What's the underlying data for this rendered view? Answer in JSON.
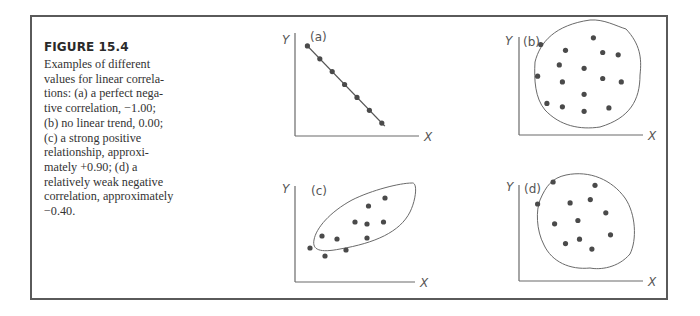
{
  "figure": {
    "title": "FIGURE 15.4",
    "caption_lines": [
      "Examples of different",
      "values for linear correla-",
      "tions: (a) a perfect nega-",
      "tive correlation, −1.00;",
      "(b) no linear trend, 0.00;",
      "(c) a strong positive",
      "relationship, approxi-",
      "mately +0.90; (d) a",
      "relatively weak negative",
      "correlation, approximately",
      "−0.40."
    ]
  },
  "chart_data": [
    {
      "type": "scatter",
      "panel": "(a)",
      "xlabel": "X",
      "ylabel": "Y",
      "correlation": -1.0,
      "description": "perfect negative correlation",
      "fit_line": true,
      "envelope": "none",
      "points": [
        [
          1,
          7
        ],
        [
          2,
          6
        ],
        [
          3,
          5
        ],
        [
          4,
          4
        ],
        [
          5,
          3
        ],
        [
          6,
          2
        ],
        [
          7,
          1
        ]
      ],
      "xlim": [
        0,
        10
      ],
      "ylim": [
        0,
        8
      ]
    },
    {
      "type": "scatter",
      "panel": "(b)",
      "xlabel": "X",
      "ylabel": "Y",
      "correlation": 0.0,
      "description": "no linear trend",
      "envelope": "circle",
      "points": [
        [
          1.4,
          8.0
        ],
        [
          3.0,
          7.5
        ],
        [
          4.8,
          8.6
        ],
        [
          5.4,
          7.3
        ],
        [
          6.4,
          7.1
        ],
        [
          2.6,
          6.2
        ],
        [
          4.2,
          5.9
        ],
        [
          1.2,
          5.2
        ],
        [
          2.8,
          4.7
        ],
        [
          5.4,
          5.0
        ],
        [
          6.6,
          4.7
        ],
        [
          4.2,
          3.6
        ],
        [
          1.8,
          2.8
        ],
        [
          2.8,
          2.5
        ],
        [
          4.2,
          2.1
        ],
        [
          5.8,
          2.4
        ]
      ],
      "xlim": [
        0,
        8
      ],
      "ylim": [
        0,
        10
      ]
    },
    {
      "type": "scatter",
      "panel": "(c)",
      "xlabel": "X",
      "ylabel": "Y",
      "correlation": 0.9,
      "description": "strong positive relationship",
      "envelope": "tilted-ellipse",
      "points": [
        [
          1.0,
          3.4
        ],
        [
          1.8,
          4.6
        ],
        [
          2.0,
          2.6
        ],
        [
          2.8,
          4.3
        ],
        [
          3.4,
          3.2
        ],
        [
          4.0,
          6.0
        ],
        [
          4.8,
          5.8
        ],
        [
          4.8,
          4.4
        ],
        [
          4.9,
          7.6
        ],
        [
          5.9,
          6.0
        ],
        [
          6.0,
          8.4
        ]
      ],
      "xlim": [
        0,
        8
      ],
      "ylim": [
        0,
        10
      ]
    },
    {
      "type": "scatter",
      "panel": "(d)",
      "xlabel": "X",
      "ylabel": "Y",
      "correlation": -0.4,
      "description": "relatively weak negative correlation",
      "envelope": "ellipse",
      "points": [
        [
          2.2,
          9.0
        ],
        [
          4.9,
          8.7
        ],
        [
          1.2,
          7.0
        ],
        [
          3.3,
          7.1
        ],
        [
          4.6,
          7.4
        ],
        [
          5.6,
          6.2
        ],
        [
          2.3,
          5.2
        ],
        [
          3.8,
          5.5
        ],
        [
          5.9,
          4.2
        ],
        [
          3.0,
          3.4
        ],
        [
          3.9,
          3.8
        ],
        [
          4.7,
          2.9
        ]
      ],
      "xlim": [
        0,
        8
      ],
      "ylim": [
        0,
        10
      ]
    }
  ]
}
